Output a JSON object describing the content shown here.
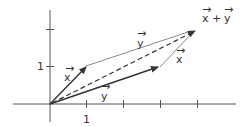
{
  "diagram": {
    "axes": {
      "x_tick_labels": [
        "1"
      ],
      "y_tick_labels": [
        "1"
      ],
      "x_ticks": [
        1,
        2,
        3,
        4
      ],
      "y_ticks": [
        1,
        2
      ]
    },
    "vectors": [
      {
        "name": "x",
        "label": "x",
        "from": [
          0,
          0
        ],
        "to": [
          1,
          1
        ],
        "style": "solid-bold"
      },
      {
        "name": "y",
        "label": "y",
        "from": [
          0,
          0
        ],
        "to": [
          3,
          1
        ],
        "style": "solid-bold"
      },
      {
        "name": "x_plus_y",
        "label": "x + y",
        "from": [
          0,
          0
        ],
        "to": [
          4,
          2
        ],
        "style": "dashed"
      },
      {
        "name": "y_translated",
        "label": "y",
        "from": [
          1,
          1
        ],
        "to": [
          4,
          2
        ],
        "style": "solid-thin"
      },
      {
        "name": "x_translated",
        "label": "x",
        "from": [
          3,
          1
        ],
        "to": [
          4,
          2
        ],
        "style": "solid-thin"
      }
    ],
    "labels": {
      "x_vec": "x",
      "y_vec": "y",
      "y_top": "y",
      "x_right": "x",
      "sum_x": "x",
      "sum_plus": "+",
      "sum_y": "y",
      "tick_x1": "1",
      "tick_y1": "1"
    },
    "colors": {
      "axis": "#555555",
      "vector": "#333333",
      "thin": "#888888",
      "text": "#333333"
    }
  }
}
